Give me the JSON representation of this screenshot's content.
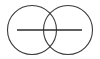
{
  "figure": {
    "width": 100,
    "height": 59,
    "background_color": "#ffffff"
  },
  "chart_data": {
    "type": "diagram",
    "subtype": "venn-two-set",
    "title": "",
    "xlabel": "",
    "ylabel": "",
    "grid": false,
    "legend": null,
    "shapes": [
      {
        "name": "left-circle",
        "type": "circle",
        "cx": 32,
        "cy": 30,
        "r": 24.5,
        "stroke": "#3a3a3a",
        "stroke_width": 1.1,
        "fill": "none"
      },
      {
        "name": "right-circle",
        "type": "circle",
        "cx": 68,
        "cy": 30,
        "r": 24.5,
        "stroke": "#3a3a3a",
        "stroke_width": 1.1,
        "fill": "none"
      },
      {
        "name": "horizontal-axis-line",
        "type": "line",
        "x1": 17,
        "y1": 30,
        "x2": 82,
        "y2": 30,
        "stroke": "#2b2b2b",
        "stroke_width": 1.4
      }
    ],
    "intersection_points": [
      {
        "name": "upper-intersection",
        "x": 50,
        "y": 10
      },
      {
        "name": "lower-intersection",
        "x": 50,
        "y": 49
      }
    ],
    "annotations": []
  },
  "colors": {
    "stroke": "#3a3a3a",
    "line": "#2b2b2b",
    "background": "#ffffff"
  }
}
